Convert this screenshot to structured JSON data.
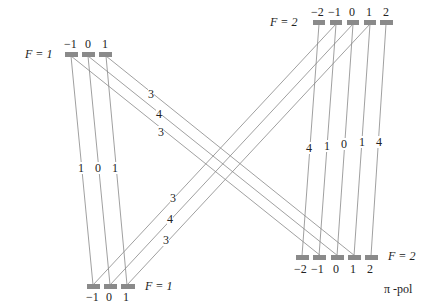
{
  "levels": {
    "top_left": {
      "label": "F = 1",
      "sublevels": [
        "−1",
        "0",
        "1"
      ]
    },
    "top_right": {
      "label": "F = 2",
      "sublevels": [
        "−2",
        "−1",
        "0",
        "1",
        "2"
      ]
    },
    "bottom_left": {
      "label": "F = 1",
      "sublevels": [
        "−1",
        "0",
        "1"
      ]
    },
    "bottom_right": {
      "label": "F = 2",
      "sublevels": [
        "−2",
        "−1",
        "0",
        "1",
        "2"
      ]
    }
  },
  "transitions": {
    "tl_to_bl_vertical": [
      "1",
      "0",
      "1"
    ],
    "tl_to_br_diagonal": [
      "3",
      "4",
      "3"
    ],
    "tr_to_bl_diagonal": [
      "3",
      "4",
      "3"
    ],
    "tr_to_br_vertical": [
      "4",
      "1",
      "0",
      "1",
      "4"
    ]
  },
  "polarization": "π -pol",
  "colors": {
    "bar": "#8a8a8a",
    "line": "#777777"
  }
}
